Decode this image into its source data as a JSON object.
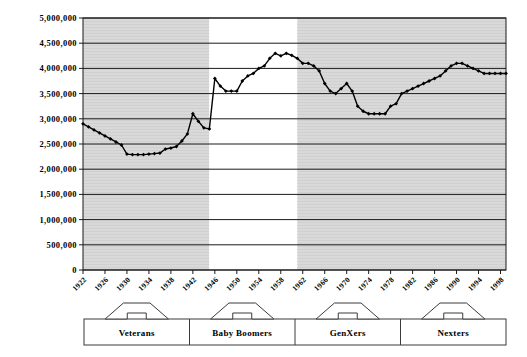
{
  "chart_data": {
    "type": "line",
    "title": "",
    "subtitle": "",
    "xlabel": "",
    "ylabel": "",
    "ylim": [
      0,
      5000000
    ],
    "xlim": [
      1922,
      1999
    ],
    "grid": true,
    "legend_position": "none",
    "ytick_labels": [
      "5,000,000",
      "4,500,000",
      "4,000,000",
      "3,500,000",
      "3,000,000",
      "2,500,000",
      "2,000,000",
      "1,500,000",
      "1,000,000",
      "500,000",
      "0"
    ],
    "ytick_values": [
      5000000,
      4500000,
      4000000,
      3500000,
      3000000,
      2500000,
      2000000,
      1500000,
      1000000,
      500000,
      0
    ],
    "xtick_labels": [
      "1922",
      "1926",
      "1930",
      "1934",
      "1938",
      "1942",
      "1946",
      "1950",
      "1954",
      "1958",
      "1962",
      "1966",
      "1970",
      "1974",
      "1978",
      "1982",
      "1986",
      "1990",
      "1994",
      "1998"
    ],
    "xtick_values": [
      1922,
      1926,
      1930,
      1934,
      1938,
      1942,
      1946,
      1950,
      1954,
      1958,
      1962,
      1966,
      1970,
      1974,
      1978,
      1982,
      1986,
      1990,
      1994,
      1998
    ],
    "series": [
      {
        "name": "US Births",
        "marker": "diamond",
        "color": "#000000",
        "x": [
          1922,
          1923,
          1924,
          1925,
          1926,
          1927,
          1928,
          1929,
          1930,
          1931,
          1932,
          1933,
          1934,
          1935,
          1936,
          1937,
          1938,
          1939,
          1940,
          1941,
          1942,
          1943,
          1944,
          1945,
          1946,
          1947,
          1948,
          1949,
          1950,
          1951,
          1952,
          1953,
          1954,
          1955,
          1956,
          1957,
          1958,
          1959,
          1960,
          1961,
          1962,
          1963,
          1964,
          1965,
          1966,
          1967,
          1968,
          1969,
          1970,
          1971,
          1972,
          1973,
          1974,
          1975,
          1976,
          1977,
          1978,
          1979,
          1980,
          1981,
          1982,
          1983,
          1984,
          1985,
          1986,
          1987,
          1988,
          1989,
          1990,
          1991,
          1992,
          1993,
          1994,
          1995,
          1996,
          1997,
          1998,
          1999
        ],
        "y": [
          2900000,
          2840000,
          2780000,
          2720000,
          2660000,
          2600000,
          2540000,
          2480000,
          2300000,
          2290000,
          2290000,
          2290000,
          2300000,
          2310000,
          2320000,
          2400000,
          2420000,
          2450000,
          2560000,
          2700000,
          3100000,
          2950000,
          2820000,
          2800000,
          3800000,
          3650000,
          3550000,
          3550000,
          3550000,
          3750000,
          3850000,
          3900000,
          4000000,
          4050000,
          4200000,
          4300000,
          4250000,
          4300000,
          4260000,
          4200000,
          4100000,
          4100000,
          4050000,
          3950000,
          3700000,
          3550000,
          3500000,
          3600000,
          3700000,
          3550000,
          3250000,
          3150000,
          3100000,
          3100000,
          3100000,
          3100000,
          3250000,
          3300000,
          3500000,
          3550000,
          3600000,
          3650000,
          3700000,
          3750000,
          3800000,
          3850000,
          3950000,
          4050000,
          4100000,
          4100000,
          4050000,
          4000000,
          3950000,
          3900000,
          3900000,
          3900000,
          3900000,
          3900000
        ]
      }
    ],
    "shaded_bands": [
      {
        "from": 1922,
        "to": 1945,
        "color": "#d9d9d9",
        "label": "Veterans"
      },
      {
        "from": 1945,
        "to": 1961,
        "color": "#ffffff",
        "label": "Baby Boomers"
      },
      {
        "from": 1961,
        "to": 1999,
        "color": "#d9d9d9",
        "label": "GenXers"
      }
    ]
  },
  "generation_brackets": [
    {
      "label": "Veterans"
    },
    {
      "label": "Baby Boomers"
    },
    {
      "label": "GenXers"
    },
    {
      "label": "Nexters"
    }
  ],
  "colors": {
    "line": "#000000",
    "band_gray": "#d9d9d9",
    "band_white": "#ffffff",
    "grid": "#000000",
    "axis": "#000000",
    "background": "#ffffff"
  }
}
